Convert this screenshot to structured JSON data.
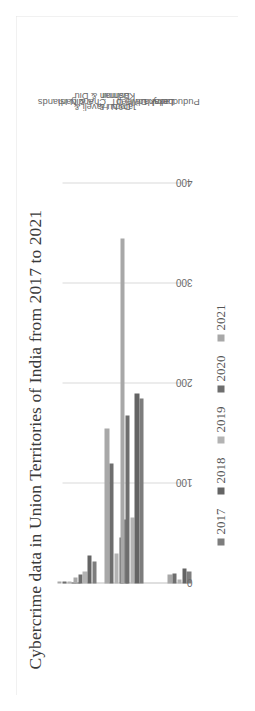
{
  "chart_data": {
    "type": "bar",
    "orientation": "horizontal-rotated",
    "title": "Cybercrime data in  Union Territories of India from 2017 to 2021",
    "xlabel": "",
    "ylabel": "",
    "categories": [
      "A & N Islands",
      "Chandigarh",
      "D&N Haveli &\nDaman & Diu",
      "Jammu &\nKashmir",
      "Delhi UT",
      "Lakshadweep",
      "Ladakh",
      "Puducherry"
    ],
    "series": [
      {
        "name": "2017",
        "color": "#7d7d7d",
        "values": [
          1,
          22,
          0,
          64,
          185,
          0,
          0,
          12
        ]
      },
      {
        "name": "2018",
        "color": "#646464",
        "values": [
          1,
          28,
          0,
          46,
          190,
          0,
          0,
          15
        ]
      },
      {
        "name": "2019",
        "color": "#b3b3b3",
        "values": [
          2,
          12,
          0,
          30,
          66,
          0,
          0,
          4
        ]
      },
      {
        "name": "2020",
        "color": "#6e6e6e",
        "values": [
          2,
          9,
          0,
          120,
          168,
          0,
          0,
          10
        ]
      },
      {
        "name": "2021",
        "color": "#a8a8a8",
        "values": [
          2,
          6,
          0,
          155,
          345,
          0,
          0,
          9
        ]
      }
    ],
    "ticks": [
      0,
      100,
      200,
      300,
      400
    ],
    "xlim": [
      0,
      430
    ],
    "grid": true,
    "legend_position": "bottom",
    "legend_entries": [
      "2017",
      "2018",
      "2019",
      "2020",
      "2021"
    ]
  },
  "colors": {
    "background": "#ffffff",
    "frame_border": "#e3e3e3",
    "gridline": "#d9d9d9",
    "axis": "#bfbfbf",
    "title_text": "#3a3a3a",
    "tick_text": "#6a6a6a",
    "category_text": "#6a6a6a",
    "legend_text": "#555555"
  }
}
